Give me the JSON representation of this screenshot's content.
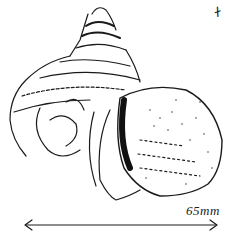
{
  "figure": {
    "scale_bar": {
      "label": "65mm",
      "arrows": "both-ends"
    },
    "corner_mark": "ᚋ",
    "ink_color": "#1a1a1a",
    "background": "#ffffff"
  }
}
